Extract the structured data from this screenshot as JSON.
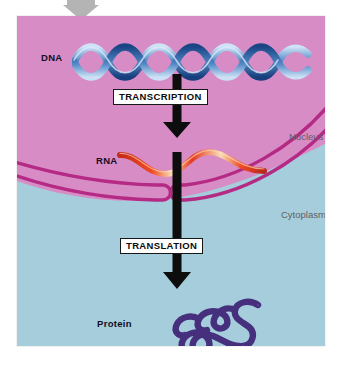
{
  "figure": {
    "labels": {
      "dna": "DNA",
      "rna": "RNA",
      "protein": "Protein",
      "nucleus": "Nucleus",
      "cytoplasm": "Cytoplasm"
    },
    "processes": {
      "transcription": "TRANSCRIPTION",
      "translation": "TRANSLATION"
    },
    "colors": {
      "nucleus_fill": "#d88cc6",
      "cytoplasm_fill": "#a5cddb",
      "membrane": "#b42a84",
      "dna_strand_light": "#9fc4e8",
      "dna_strand_dark": "#1c4a88",
      "rna_strand": "#e03a22",
      "rna_highlight": "#f6d7a8",
      "protein_bead": "#46307e",
      "arrow": "#0d0d0d",
      "region_label": "#5f5f66",
      "bold_label": "#120d24",
      "top_marker": "#b4b4b4",
      "page_background": "#ffffff"
    },
    "icons": {
      "top_marker": "down-triangle-marker-icon",
      "transcription_arrow": "down-arrow-icon",
      "translation_arrow": "down-arrow-icon"
    }
  }
}
